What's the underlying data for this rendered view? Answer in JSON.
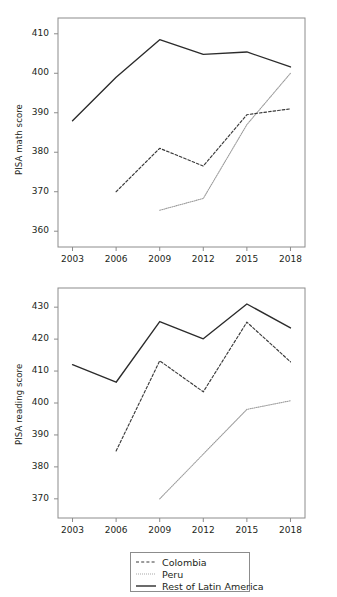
{
  "figure": {
    "title": "",
    "background": "#ffffff",
    "series_colors": {
      "colombia": "#3a3a3a",
      "peru": "#9a9a9a",
      "rest_of_latin_america": "#2b2b2b"
    }
  },
  "legend": {
    "position": "bottom-center",
    "entries": [
      {
        "label": "Colombia",
        "style": "dashed",
        "key": "dashed-line-key"
      },
      {
        "label": "Peru",
        "style": "dotted",
        "key": "dotted-line-key"
      },
      {
        "label": "Rest of Latin America",
        "style": "solid",
        "key": "solid-line-key"
      }
    ]
  },
  "chart_data": [
    {
      "type": "line",
      "title": "",
      "xlabel": "",
      "ylabel": "PISA math score",
      "x": [
        2003,
        2006,
        2009,
        2012,
        2015,
        2018
      ],
      "xticklabels": [
        "2003",
        "2006",
        "2009",
        "2012",
        "2015",
        "2018"
      ],
      "yticks": [
        360,
        370,
        380,
        390,
        400,
        410
      ],
      "yticklabels": [
        "360",
        "370",
        "380",
        "390",
        "400",
        "410"
      ],
      "xlim": [
        2002,
        2019
      ],
      "ylim": [
        356,
        414
      ],
      "grid": false,
      "series": [
        {
          "name": "Colombia",
          "style": "dashed",
          "x": [
            2006,
            2009,
            2012,
            2015,
            2018
          ],
          "values": [
            370.0,
            381.0,
            376.5,
            389.5,
            391.0
          ]
        },
        {
          "name": "Peru",
          "style": "dotted",
          "x": [
            2009,
            2012,
            2015,
            2018
          ],
          "values": [
            365.3,
            368.3,
            387.0,
            400.0
          ]
        },
        {
          "name": "Rest of Latin America",
          "style": "solid",
          "x": [
            2003,
            2006,
            2009,
            2012,
            2015,
            2018
          ],
          "values": [
            388.0,
            399.0,
            408.5,
            404.8,
            405.4,
            401.6
          ]
        }
      ]
    },
    {
      "type": "line",
      "title": "",
      "xlabel": "",
      "ylabel": "PISA reading score",
      "x": [
        2003,
        2006,
        2009,
        2012,
        2015,
        2018
      ],
      "xticklabels": [
        "2003",
        "2006",
        "2009",
        "2012",
        "2015",
        "2018"
      ],
      "yticks": [
        370,
        380,
        390,
        400,
        410,
        420,
        430
      ],
      "yticklabels": [
        "370",
        "380",
        "390",
        "400",
        "410",
        "420",
        "430"
      ],
      "xlim": [
        2002,
        2019
      ],
      "ylim": [
        364,
        436
      ],
      "grid": false,
      "series": [
        {
          "name": "Colombia",
          "style": "dashed",
          "x": [
            2006,
            2009,
            2012,
            2015,
            2018
          ],
          "values": [
            385.0,
            413.2,
            403.5,
            425.3,
            412.9
          ]
        },
        {
          "name": "Peru",
          "style": "dotted",
          "x": [
            2009,
            2012,
            2015,
            2018
          ],
          "values": [
            370.0,
            384.0,
            398.0,
            400.7
          ]
        },
        {
          "name": "Rest of Latin America",
          "style": "solid",
          "x": [
            2003,
            2006,
            2009,
            2012,
            2015,
            2018
          ],
          "values": [
            412.0,
            406.5,
            425.5,
            420.1,
            431.0,
            423.5
          ]
        }
      ]
    }
  ]
}
